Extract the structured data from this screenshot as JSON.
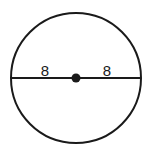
{
  "figure": {
    "kind": "geometry-diagram",
    "background_color": "#ffffff",
    "stroke_color": "#1a1a1a",
    "label_color": "#1a1a1a"
  },
  "circle": {
    "name": "circle-outline",
    "center_x": 76,
    "center_y": 78,
    "radius": 65,
    "stroke_width": 2,
    "fill": "none"
  },
  "center_point": {
    "name": "center-dot",
    "x": 76,
    "y": 78,
    "radius": 4.5,
    "fill": "#1a1a1a"
  },
  "diameter": {
    "name": "diameter-line",
    "x1": 11,
    "y1": 78,
    "x2": 141,
    "y2": 78,
    "stroke_width": 2
  },
  "labels": {
    "left_radius": {
      "text": "8",
      "x": 45,
      "y": 76,
      "font_size": 15
    },
    "right_radius": {
      "text": "8",
      "x": 107,
      "y": 76,
      "font_size": 15
    }
  }
}
